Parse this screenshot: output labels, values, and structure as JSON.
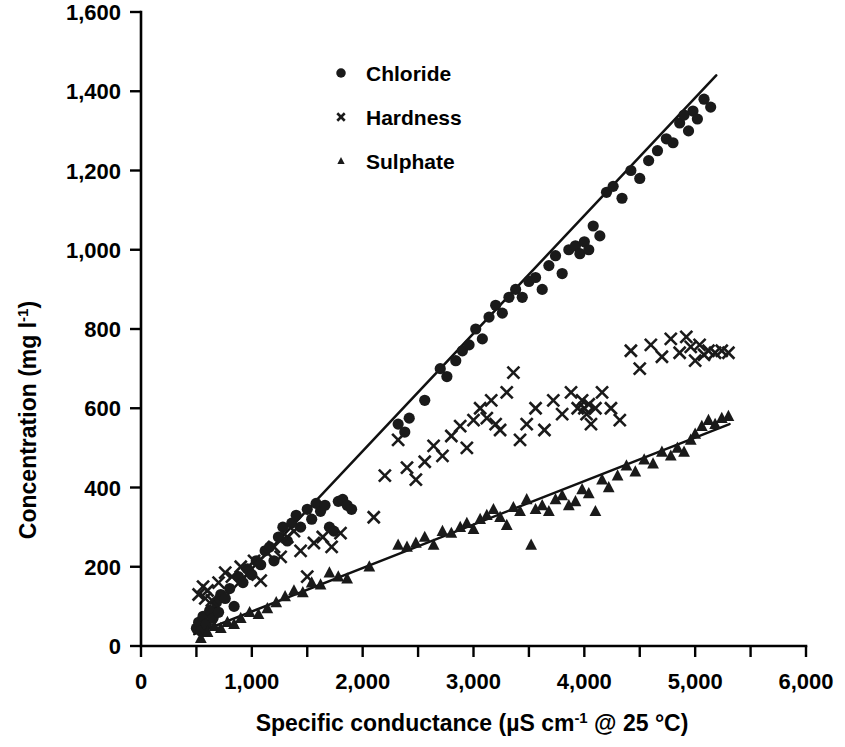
{
  "chart_data": {
    "type": "scatter",
    "title": "",
    "xlabel": "Specific conductance   (µS cm-1 @ 25 °C)",
    "ylabel": "Concentration  (mg l-1)",
    "xlim": [
      0,
      6000
    ],
    "ylim": [
      0,
      1600
    ],
    "grid": false,
    "legend_position": "top-center",
    "x_ticks": [
      0,
      500,
      1000,
      1500,
      2000,
      2500,
      3000,
      3500,
      4000,
      4500,
      5000,
      5500,
      6000
    ],
    "x_tick_labels": [
      "0",
      "",
      "1,000",
      "",
      "2,000",
      "",
      "3,000",
      "",
      "4,000",
      "",
      "5,000",
      "",
      "6,000"
    ],
    "y_ticks": [
      0,
      200,
      400,
      600,
      800,
      1000,
      1200,
      1400,
      1600
    ],
    "y_tick_labels": [
      "0",
      "200",
      "400",
      "600",
      "800",
      "1,000",
      "1,200",
      "1,400",
      "1,600"
    ],
    "series": [
      {
        "name": "Chloride",
        "marker": "circle",
        "color": "#1a1a1a",
        "points": [
          [
            500,
            45
          ],
          [
            520,
            60
          ],
          [
            540,
            38
          ],
          [
            560,
            75
          ],
          [
            590,
            55
          ],
          [
            620,
            90
          ],
          [
            650,
            70
          ],
          [
            680,
            110
          ],
          [
            700,
            85
          ],
          [
            720,
            130
          ],
          [
            760,
            120
          ],
          [
            800,
            145
          ],
          [
            840,
            100
          ],
          [
            880,
            175
          ],
          [
            920,
            160
          ],
          [
            960,
            195
          ],
          [
            1000,
            180
          ],
          [
            1040,
            215
          ],
          [
            1080,
            205
          ],
          [
            1120,
            240
          ],
          [
            1160,
            250
          ],
          [
            1200,
            215
          ],
          [
            1240,
            275
          ],
          [
            1280,
            300
          ],
          [
            1320,
            265
          ],
          [
            1360,
            310
          ],
          [
            1400,
            330
          ],
          [
            1440,
            300
          ],
          [
            1500,
            345
          ],
          [
            1540,
            320
          ],
          [
            1580,
            360
          ],
          [
            1620,
            340
          ],
          [
            1660,
            355
          ],
          [
            1700,
            300
          ],
          [
            1740,
            290
          ],
          [
            1780,
            365
          ],
          [
            1820,
            370
          ],
          [
            1860,
            355
          ],
          [
            1900,
            345
          ],
          [
            2320,
            560
          ],
          [
            2380,
            540
          ],
          [
            2420,
            575
          ],
          [
            2560,
            620
          ],
          [
            2700,
            700
          ],
          [
            2760,
            680
          ],
          [
            2840,
            720
          ],
          [
            2900,
            745
          ],
          [
            2960,
            760
          ],
          [
            3020,
            800
          ],
          [
            3080,
            775
          ],
          [
            3140,
            830
          ],
          [
            3200,
            860
          ],
          [
            3260,
            840
          ],
          [
            3320,
            880
          ],
          [
            3380,
            900
          ],
          [
            3440,
            880
          ],
          [
            3500,
            920
          ],
          [
            3560,
            930
          ],
          [
            3620,
            900
          ],
          [
            3680,
            960
          ],
          [
            3740,
            985
          ],
          [
            3800,
            940
          ],
          [
            3860,
            1000
          ],
          [
            3920,
            1010
          ],
          [
            3960,
            990
          ],
          [
            4000,
            1020
          ],
          [
            4040,
            1000
          ],
          [
            4080,
            1060
          ],
          [
            4140,
            1035
          ],
          [
            4200,
            1145
          ],
          [
            4260,
            1160
          ],
          [
            4340,
            1130
          ],
          [
            4420,
            1200
          ],
          [
            4500,
            1180
          ],
          [
            4580,
            1225
          ],
          [
            4660,
            1250
          ],
          [
            4740,
            1280
          ],
          [
            4800,
            1270
          ],
          [
            4860,
            1320
          ],
          [
            4900,
            1340
          ],
          [
            4940,
            1300
          ],
          [
            4980,
            1350
          ],
          [
            5020,
            1330
          ],
          [
            5080,
            1380
          ],
          [
            5140,
            1360
          ]
        ],
        "fit_line": {
          "x": [
            480,
            5190
          ],
          "y": [
            40,
            1440
          ]
        }
      },
      {
        "name": "Hardness",
        "marker": "cross",
        "color": "#1a1a1a",
        "points": [
          [
            520,
            130
          ],
          [
            560,
            150
          ],
          [
            580,
            120
          ],
          [
            600,
            140
          ],
          [
            640,
            115
          ],
          [
            700,
            160
          ],
          [
            760,
            185
          ],
          [
            820,
            175
          ],
          [
            900,
            200
          ],
          [
            960,
            180
          ],
          [
            1020,
            215
          ],
          [
            1080,
            165
          ],
          [
            1140,
            235
          ],
          [
            1200,
            250
          ],
          [
            1260,
            225
          ],
          [
            1320,
            275
          ],
          [
            1380,
            290
          ],
          [
            1440,
            240
          ],
          [
            1500,
            175
          ],
          [
            1560,
            260
          ],
          [
            1640,
            275
          ],
          [
            1720,
            250
          ],
          [
            1800,
            285
          ],
          [
            2100,
            325
          ],
          [
            2200,
            430
          ],
          [
            2320,
            520
          ],
          [
            2400,
            450
          ],
          [
            2480,
            420
          ],
          [
            2560,
            465
          ],
          [
            2640,
            505
          ],
          [
            2720,
            480
          ],
          [
            2800,
            530
          ],
          [
            2880,
            555
          ],
          [
            2940,
            500
          ],
          [
            3000,
            570
          ],
          [
            3060,
            600
          ],
          [
            3120,
            575
          ],
          [
            3160,
            620
          ],
          [
            3200,
            560
          ],
          [
            3240,
            545
          ],
          [
            3300,
            640
          ],
          [
            3360,
            690
          ],
          [
            3420,
            520
          ],
          [
            3480,
            560
          ],
          [
            3560,
            600
          ],
          [
            3640,
            545
          ],
          [
            3720,
            620
          ],
          [
            3800,
            585
          ],
          [
            3880,
            640
          ],
          [
            3940,
            600
          ],
          [
            3980,
            620
          ],
          [
            4000,
            600
          ],
          [
            4020,
            585
          ],
          [
            4040,
            610
          ],
          [
            4060,
            560
          ],
          [
            4100,
            600
          ],
          [
            4160,
            640
          ],
          [
            4240,
            600
          ],
          [
            4320,
            570
          ],
          [
            4420,
            745
          ],
          [
            4500,
            700
          ],
          [
            4600,
            760
          ],
          [
            4700,
            730
          ],
          [
            4780,
            775
          ],
          [
            4860,
            740
          ],
          [
            4920,
            780
          ],
          [
            4960,
            755
          ],
          [
            5000,
            720
          ],
          [
            5040,
            760
          ],
          [
            5080,
            735
          ],
          [
            5120,
            745
          ],
          [
            5180,
            740
          ],
          [
            5240,
            745
          ],
          [
            5300,
            740
          ]
        ],
        "fit_line": null
      },
      {
        "name": "Sulphate",
        "marker": "triangle",
        "color": "#1a1a1a",
        "points": [
          [
            540,
            20
          ],
          [
            600,
            35
          ],
          [
            660,
            50
          ],
          [
            720,
            45
          ],
          [
            780,
            60
          ],
          [
            840,
            55
          ],
          [
            900,
            70
          ],
          [
            980,
            85
          ],
          [
            1060,
            80
          ],
          [
            1140,
            95
          ],
          [
            1220,
            110
          ],
          [
            1300,
            125
          ],
          [
            1380,
            140
          ],
          [
            1460,
            135
          ],
          [
            1540,
            160
          ],
          [
            1620,
            155
          ],
          [
            1700,
            185
          ],
          [
            1780,
            175
          ],
          [
            1860,
            170
          ],
          [
            2060,
            200
          ],
          [
            2320,
            255
          ],
          [
            2400,
            250
          ],
          [
            2480,
            260
          ],
          [
            2560,
            275
          ],
          [
            2640,
            255
          ],
          [
            2720,
            290
          ],
          [
            2800,
            285
          ],
          [
            2880,
            300
          ],
          [
            2940,
            310
          ],
          [
            3000,
            295
          ],
          [
            3060,
            320
          ],
          [
            3120,
            330
          ],
          [
            3180,
            345
          ],
          [
            3240,
            325
          ],
          [
            3300,
            305
          ],
          [
            3360,
            350
          ],
          [
            3420,
            340
          ],
          [
            3480,
            370
          ],
          [
            3520,
            255
          ],
          [
            3560,
            345
          ],
          [
            3620,
            355
          ],
          [
            3680,
            340
          ],
          [
            3740,
            370
          ],
          [
            3800,
            380
          ],
          [
            3860,
            355
          ],
          [
            3920,
            365
          ],
          [
            3980,
            395
          ],
          [
            4040,
            385
          ],
          [
            4100,
            340
          ],
          [
            4160,
            420
          ],
          [
            4220,
            400
          ],
          [
            4300,
            430
          ],
          [
            4380,
            455
          ],
          [
            4460,
            440
          ],
          [
            4540,
            470
          ],
          [
            4620,
            460
          ],
          [
            4700,
            490
          ],
          [
            4780,
            480
          ],
          [
            4840,
            500
          ],
          [
            4900,
            490
          ],
          [
            4960,
            520
          ],
          [
            5000,
            535
          ],
          [
            5060,
            555
          ],
          [
            5120,
            570
          ],
          [
            5180,
            560
          ],
          [
            5240,
            575
          ],
          [
            5300,
            580
          ]
        ],
        "fit_line": {
          "x": [
            480,
            5310
          ],
          "y": [
            30,
            560
          ]
        }
      }
    ]
  },
  "legend": {
    "items": [
      {
        "label": "Chloride",
        "marker": "circle"
      },
      {
        "label": "Hardness",
        "marker": "cross"
      },
      {
        "label": "Sulphate",
        "marker": "triangle"
      }
    ]
  },
  "axis_text": {
    "x_title_main": "Specific conductance",
    "x_title_unit_pre": "(µS cm",
    "x_title_unit_sup": "-1",
    "x_title_unit_post": " @ 25 °C)",
    "y_title_main": "Concentration  (mg l",
    "y_title_sup": "-1",
    "y_title_post": ")"
  }
}
